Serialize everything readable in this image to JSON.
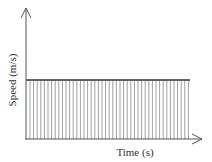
{
  "chart_data": {
    "type": "area",
    "title": "",
    "xlabel": "Time (s)",
    "ylabel": "Speed (m/s)",
    "x": [
      0,
      1
    ],
    "values": [
      1,
      1
    ],
    "xlim": [
      0,
      1
    ],
    "ylim": [
      0,
      1.7
    ],
    "grid": false,
    "legend": null,
    "ticks": {
      "x": [],
      "y": []
    },
    "fill": "vertical-hatch"
  },
  "colors": {
    "axis": "#555555",
    "line": "#333333",
    "hatch": "#888888",
    "text": "#333333"
  }
}
